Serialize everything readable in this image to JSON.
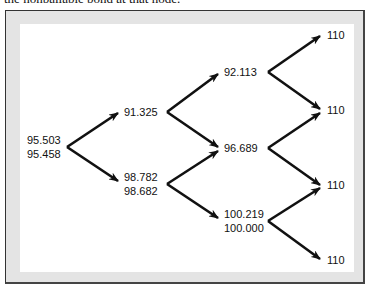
{
  "caption": "the nonbailable bond at that node.",
  "nodes": {
    "root": {
      "line1": "95.503",
      "line2": "95.458"
    },
    "t1_up": {
      "line1": "91.325"
    },
    "t1_down": {
      "line1": "98.782",
      "line2": "98.682"
    },
    "t2_up": {
      "line1": "92.113"
    },
    "t2_mid": {
      "line1": "96.689"
    },
    "t2_down": {
      "line1": "100.219",
      "line2": "100.000"
    },
    "t3": [
      {
        "value": "110"
      },
      {
        "value": "110"
      },
      {
        "value": "110"
      },
      {
        "value": "110"
      }
    ]
  },
  "colors": {
    "frame_band": "#e4e4e4",
    "frame_border": "#333333",
    "arrow": "#111111"
  }
}
